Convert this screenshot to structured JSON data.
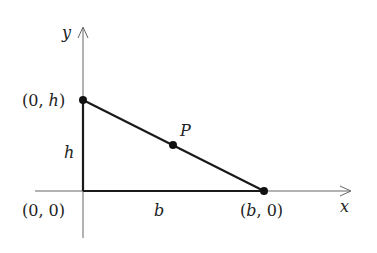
{
  "diagram": {
    "axes": {
      "x_label": "x",
      "y_label": "y"
    },
    "points": {
      "origin": {
        "label": "(0, 0)"
      },
      "top": {
        "label_open": "(0, ",
        "label_var": "h",
        "label_close": ")"
      },
      "right": {
        "label_open": "(",
        "label_var": "b",
        "label_close": ", 0)"
      },
      "p": {
        "label": "P"
      }
    },
    "sides": {
      "height": "h",
      "base": "b"
    },
    "colors": {
      "line": "#1a1a1a",
      "axis": "#555555"
    }
  }
}
